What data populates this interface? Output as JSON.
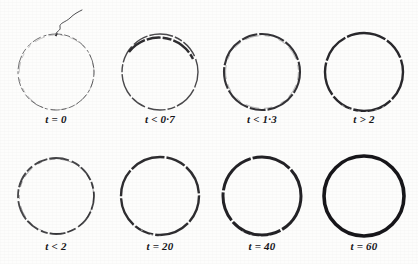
{
  "figure": {
    "caption_present": false,
    "background_color": "#fdfdfc",
    "ink_color": "#17161a",
    "rows": 2,
    "columns": 4
  },
  "panels": [
    {
      "id": "panel-1",
      "label": "t = 0",
      "time_label_raw": "t • 0",
      "row": 0,
      "column": 0,
      "stroke_width": 1.0,
      "ink_opacity": 0.62,
      "dashed": true,
      "radius": 38,
      "has_filament": true,
      "filament_name": "nucleation-filament"
    },
    {
      "id": "panel-2",
      "label": "t < 0·7",
      "time_label_raw": "t<0·7",
      "row": 0,
      "column": 1,
      "stroke_width": 1.4,
      "ink_opacity": 0.78,
      "dashed": true,
      "radius": 38,
      "has_filament": false,
      "filament_name": ""
    },
    {
      "id": "panel-3",
      "label": "t < 1·3",
      "time_label_raw": "t<1·3",
      "row": 0,
      "column": 2,
      "stroke_width": 2.1,
      "ink_opacity": 0.88,
      "dashed": true,
      "radius": 38,
      "has_filament": false,
      "filament_name": ""
    },
    {
      "id": "panel-4",
      "label": "t > 2",
      "time_label_raw": "t>2",
      "row": 0,
      "column": 3,
      "stroke_width": 2.4,
      "ink_opacity": 0.92,
      "dashed": true,
      "radius": 39,
      "has_filament": false,
      "filament_name": ""
    },
    {
      "id": "panel-5",
      "label": "t < 2",
      "time_label_raw": "t<2",
      "row": 1,
      "column": 0,
      "stroke_width": 1.8,
      "ink_opacity": 0.8,
      "dashed": true,
      "radius": 38,
      "has_filament": false,
      "filament_name": ""
    },
    {
      "id": "panel-6",
      "label": "t = 20",
      "time_label_raw": "t = 20",
      "row": 1,
      "column": 1,
      "stroke_width": 2.4,
      "ink_opacity": 0.9,
      "dashed": true,
      "radius": 39,
      "has_filament": false,
      "filament_name": ""
    },
    {
      "id": "panel-7",
      "label": "t = 40",
      "time_label_raw": "t • 40",
      "row": 1,
      "column": 2,
      "stroke_width": 3.0,
      "ink_opacity": 0.95,
      "dashed": true,
      "radius": 39,
      "has_filament": false,
      "filament_name": ""
    },
    {
      "id": "panel-8",
      "label": "t = 60",
      "time_label_raw": "t = 60",
      "row": 1,
      "column": 3,
      "stroke_width": 3.6,
      "ink_opacity": 1.0,
      "dashed": false,
      "radius": 40,
      "has_filament": false,
      "filament_name": ""
    }
  ]
}
